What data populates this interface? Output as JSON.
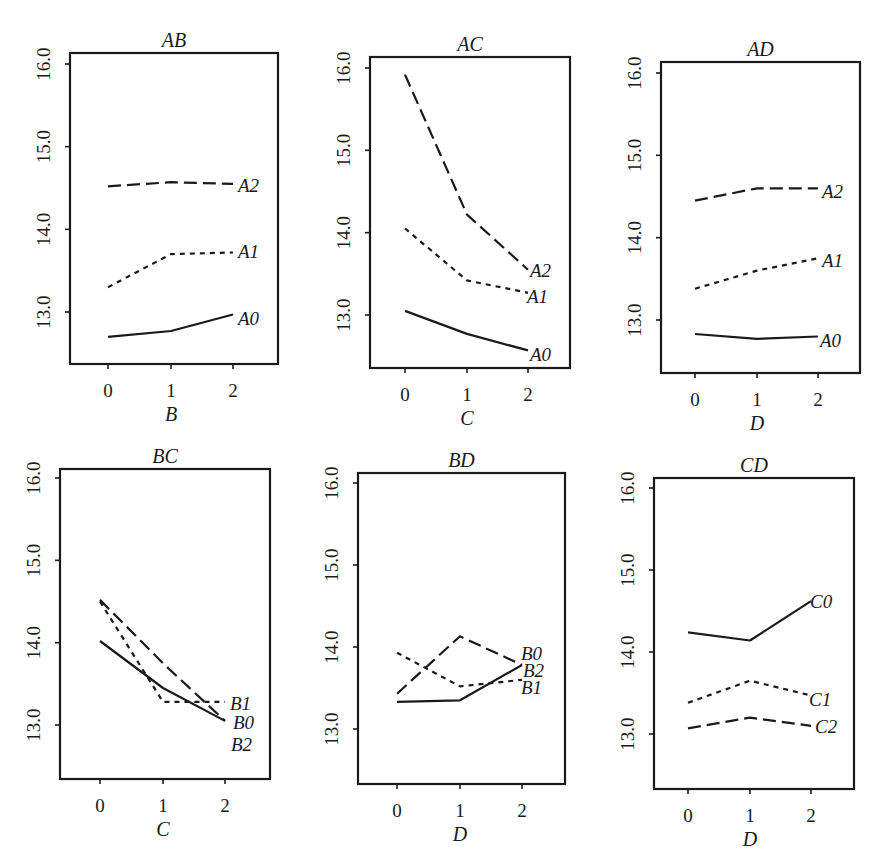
{
  "figure": {
    "ylim": [
      12.4,
      16.1
    ],
    "yticks": [
      "13.0",
      "14.0",
      "15.0",
      "16.0"
    ],
    "xticks": [
      "0",
      "1",
      "2"
    ]
  },
  "chart_data": [
    {
      "type": "line",
      "title": "AB",
      "xlabel": "B",
      "ylabel": "",
      "x": [
        0,
        1,
        2
      ],
      "ylim": [
        12.4,
        16.1
      ],
      "yticks": [
        13.0,
        14.0,
        15.0,
        16.0
      ],
      "grid": false,
      "legend_position": "inline-right",
      "series": [
        {
          "name": "A0",
          "style": "solid",
          "values": [
            12.7,
            12.77,
            12.97
          ]
        },
        {
          "name": "A1",
          "style": "dotted",
          "values": [
            13.3,
            13.7,
            13.72
          ]
        },
        {
          "name": "A2",
          "style": "dashed",
          "values": [
            14.52,
            14.57,
            14.55
          ]
        }
      ]
    },
    {
      "type": "line",
      "title": "AC",
      "xlabel": "C",
      "ylabel": "",
      "x": [
        0,
        1,
        2
      ],
      "ylim": [
        12.4,
        16.1
      ],
      "yticks": [
        13.0,
        14.0,
        15.0,
        16.0
      ],
      "grid": false,
      "legend_position": "inline-right",
      "series": [
        {
          "name": "A0",
          "style": "solid",
          "values": [
            13.05,
            12.77,
            12.57
          ]
        },
        {
          "name": "A1",
          "style": "dotted",
          "values": [
            14.05,
            13.42,
            13.27
          ]
        },
        {
          "name": "A2",
          "style": "dashed",
          "values": [
            15.92,
            14.22,
            13.55
          ]
        }
      ]
    },
    {
      "type": "line",
      "title": "AD",
      "xlabel": "D",
      "ylabel": "",
      "x": [
        0,
        1,
        2
      ],
      "ylim": [
        12.4,
        16.1
      ],
      "yticks": [
        13.0,
        14.0,
        15.0,
        16.0
      ],
      "grid": false,
      "legend_position": "inline-right",
      "series": [
        {
          "name": "A0",
          "style": "solid",
          "values": [
            12.83,
            12.77,
            12.8
          ]
        },
        {
          "name": "A1",
          "style": "dotted",
          "values": [
            13.38,
            13.6,
            13.75
          ]
        },
        {
          "name": "A2",
          "style": "dashed",
          "values": [
            14.45,
            14.6,
            14.6
          ]
        }
      ]
    },
    {
      "type": "line",
      "title": "BC",
      "xlabel": "C",
      "ylabel": "",
      "x": [
        0,
        1,
        2
      ],
      "ylim": [
        12.4,
        16.1
      ],
      "yticks": [
        13.0,
        14.0,
        15.0,
        16.0
      ],
      "grid": false,
      "legend_position": "inline-right",
      "series": [
        {
          "name": "B0",
          "style": "solid",
          "values": [
            14.02,
            13.45,
            13.05
          ]
        },
        {
          "name": "B1",
          "style": "dotted",
          "values": [
            14.5,
            13.28,
            13.28
          ]
        },
        {
          "name": "B2",
          "style": "dashed",
          "values": [
            14.52,
            13.75,
            13.05
          ]
        }
      ]
    },
    {
      "type": "line",
      "title": "BD",
      "xlabel": "D",
      "ylabel": "",
      "x": [
        0,
        1,
        2
      ],
      "ylim": [
        12.4,
        16.1
      ],
      "yticks": [
        13.0,
        14.0,
        15.0,
        16.0
      ],
      "grid": false,
      "legend_position": "inline-right",
      "series": [
        {
          "name": "B0",
          "style": "solid",
          "values": [
            13.33,
            13.35,
            13.78
          ]
        },
        {
          "name": "B1",
          "style": "dotted",
          "values": [
            13.93,
            13.52,
            13.6
          ]
        },
        {
          "name": "B2",
          "style": "dashed",
          "values": [
            13.43,
            14.13,
            13.78
          ]
        }
      ]
    },
    {
      "type": "line",
      "title": "CD",
      "xlabel": "D",
      "ylabel": "",
      "x": [
        0,
        1,
        2
      ],
      "ylim": [
        12.4,
        16.1
      ],
      "yticks": [
        13.0,
        14.0,
        15.0,
        16.0
      ],
      "grid": false,
      "legend_position": "inline-right",
      "series": [
        {
          "name": "C0",
          "style": "solid",
          "values": [
            14.24,
            14.14,
            14.62
          ]
        },
        {
          "name": "C1",
          "style": "dotted",
          "values": [
            13.38,
            13.65,
            13.47
          ]
        },
        {
          "name": "C2",
          "style": "dashed",
          "values": [
            13.07,
            13.2,
            13.1
          ]
        }
      ]
    }
  ],
  "panels_layout": [
    {
      "left": 70,
      "top": 53,
      "right": 278,
      "bottom": 364,
      "xt": [
        108,
        171,
        233
      ],
      "y16": 64,
      "y13": 312,
      "labels": [
        {
          "text": "A2",
          "dy": 0
        },
        {
          "text": "A1",
          "dy": 0
        },
        {
          "text": "A0",
          "dy": 0
        }
      ]
    },
    {
      "left": 370,
      "top": 57,
      "right": 570,
      "bottom": 368,
      "xt": [
        405,
        467,
        528
      ],
      "y16": 68,
      "y13": 315,
      "labels": [
        {
          "text": "A2",
          "dy": 0
        },
        {
          "text": "A1",
          "dy": 0
        },
        {
          "text": "A0",
          "dy": 0
        }
      ]
    },
    {
      "left": 661,
      "top": 62,
      "right": 860,
      "bottom": 373,
      "xt": [
        695,
        757,
        818
      ],
      "y16": 73,
      "y13": 320,
      "labels": [
        {
          "text": "A2",
          "dy": 0
        },
        {
          "text": "A1",
          "dy": 0
        },
        {
          "text": "A0",
          "dy": 0
        }
      ]
    },
    {
      "left": 60,
      "top": 469,
      "right": 270,
      "bottom": 779,
      "xt": [
        100,
        163,
        225
      ],
      "y16": 478,
      "y13": 725,
      "labels": [
        {
          "text": "B1",
          "dy": 0
        },
        {
          "text": "B0",
          "dy": 0
        },
        {
          "text": "B2",
          "dy": 0
        }
      ]
    },
    {
      "left": 358,
      "top": 473,
      "right": 565,
      "bottom": 784,
      "xt": [
        397,
        460,
        522
      ],
      "y16": 483,
      "y13": 729,
      "labels": [
        {
          "text": "B0",
          "dy": 0
        },
        {
          "text": "B2",
          "dy": 0
        },
        {
          "text": "B1",
          "dy": 0
        }
      ]
    },
    {
      "left": 654,
      "top": 478,
      "right": 854,
      "bottom": 789,
      "xt": [
        688,
        750,
        811
      ],
      "y16": 488,
      "y13": 734,
      "labels": [
        {
          "text": "C0",
          "dy": 0
        },
        {
          "text": "C1",
          "dy": 0
        },
        {
          "text": "C2",
          "dy": 0
        }
      ]
    }
  ],
  "series_label_positions": [
    [
      {
        "name": "A2",
        "x": 238,
        "y": 192
      },
      {
        "name": "A1",
        "x": 238,
        "y": 258
      },
      {
        "name": "A0",
        "x": 238,
        "y": 325
      }
    ],
    [
      {
        "name": "A2",
        "x": 530,
        "y": 277
      },
      {
        "name": "A1",
        "x": 527,
        "y": 303
      },
      {
        "name": "A0",
        "x": 530,
        "y": 361
      }
    ],
    [
      {
        "name": "A2",
        "x": 822,
        "y": 198
      },
      {
        "name": "A1",
        "x": 822,
        "y": 267
      },
      {
        "name": "A0",
        "x": 820,
        "y": 347
      }
    ],
    [
      {
        "name": "B1",
        "x": 230,
        "y": 710
      },
      {
        "name": "B0",
        "x": 233,
        "y": 729
      },
      {
        "name": "B2",
        "x": 231,
        "y": 751
      }
    ],
    [
      {
        "name": "B0",
        "x": 521,
        "y": 660
      },
      {
        "name": "B2",
        "x": 523,
        "y": 677
      },
      {
        "name": "B1",
        "x": 521,
        "y": 694
      }
    ],
    [
      {
        "name": "C0",
        "x": 810,
        "y": 608
      },
      {
        "name": "C1",
        "x": 809,
        "y": 706
      },
      {
        "name": "C2",
        "x": 815,
        "y": 733
      }
    ]
  ],
  "colors": {
    "ink": "#1a1a1a",
    "background": "#ffffff"
  }
}
